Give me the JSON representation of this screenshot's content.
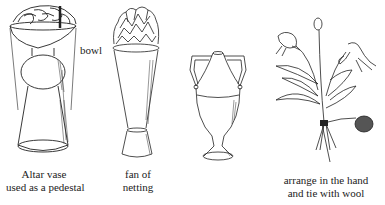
{
  "figures": [
    {
      "id": "altar-vase",
      "callout": "bowl",
      "caption_lines": [
        "Altar vase",
        "used as a pedestal"
      ]
    },
    {
      "id": "tall-vase-netting",
      "caption_lines": [
        "fan of",
        "netting"
      ]
    },
    {
      "id": "urn-vase",
      "caption_lines": []
    },
    {
      "id": "hand-bouquet",
      "caption_lines": [
        "arrange in the hand",
        "and tie with wool"
      ]
    }
  ]
}
